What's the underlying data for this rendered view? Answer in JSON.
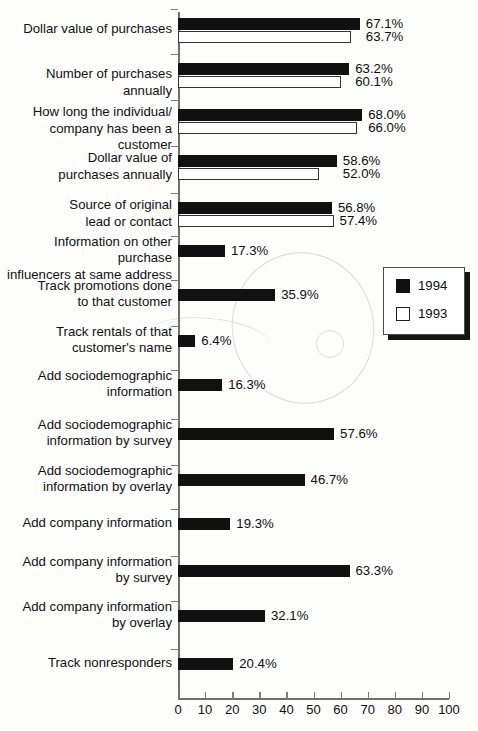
{
  "chart_data": {
    "type": "bar",
    "orientation": "horizontal",
    "title": "",
    "subtitle": "",
    "xlabel": "",
    "ylabel": "",
    "xlim": [
      0,
      100
    ],
    "xticks": [
      0,
      10,
      20,
      30,
      40,
      50,
      60,
      70,
      80,
      90,
      100
    ],
    "xticklabels": [
      "0",
      "10",
      "20",
      "30",
      "40",
      "50",
      "60",
      "70",
      "80",
      "90",
      "100"
    ],
    "grid": false,
    "legend": {
      "position": "right-middle",
      "entries": [
        {
          "name": "1994",
          "swatch": "black"
        },
        {
          "name": "1993",
          "swatch": "white"
        }
      ]
    },
    "categories": [
      "Dollar value of purchases",
      "Number of purchases annually",
      "How long the individual/\ncompany has been a customer",
      "Dollar value of\npurchases annually",
      "Source of original\nlead or contact",
      "Information on other purchase\ninfluencers at same address",
      "Track promotions done\nto that customer",
      "Track rentals of that\ncustomer's name",
      "Add sociodemographic\ninformation",
      "Add sociodemographic\ninformation by survey",
      "Add sociodemographic\ninformation by overlay",
      "Add company information",
      "Add company information\nby survey",
      "Add company information\nby overlay",
      "Track nonresponders"
    ],
    "series": [
      {
        "name": "1994",
        "values": [
          67.1,
          63.2,
          68.0,
          58.6,
          56.8,
          17.3,
          35.9,
          6.4,
          16.3,
          57.6,
          46.7,
          19.3,
          63.3,
          32.1,
          20.4
        ],
        "labels": [
          "67.1%",
          "63.2%",
          "68.0%",
          "58.6%",
          "56.8%",
          "17.3%",
          "35.9%",
          "6.4%",
          "16.3%",
          "57.6%",
          "46.7%",
          "19.3%",
          "63.3%",
          "32.1%",
          "20.4%"
        ]
      },
      {
        "name": "1993",
        "values": [
          63.7,
          60.1,
          66.0,
          52.0,
          57.4,
          null,
          null,
          null,
          null,
          null,
          null,
          null,
          null,
          null,
          null
        ],
        "labels": [
          "63.7%",
          "60.1%",
          "66.0%",
          "52.0%",
          "57.4%",
          null,
          null,
          null,
          null,
          null,
          null,
          null,
          null,
          null,
          null
        ]
      }
    ]
  },
  "colors": {
    "series_1994": "#111111",
    "series_1993": "#ffffff",
    "series_1993_edge": "#333333",
    "axis": "#6d6f70",
    "text": "#0d0d0d",
    "background": "#fdfdfc"
  }
}
